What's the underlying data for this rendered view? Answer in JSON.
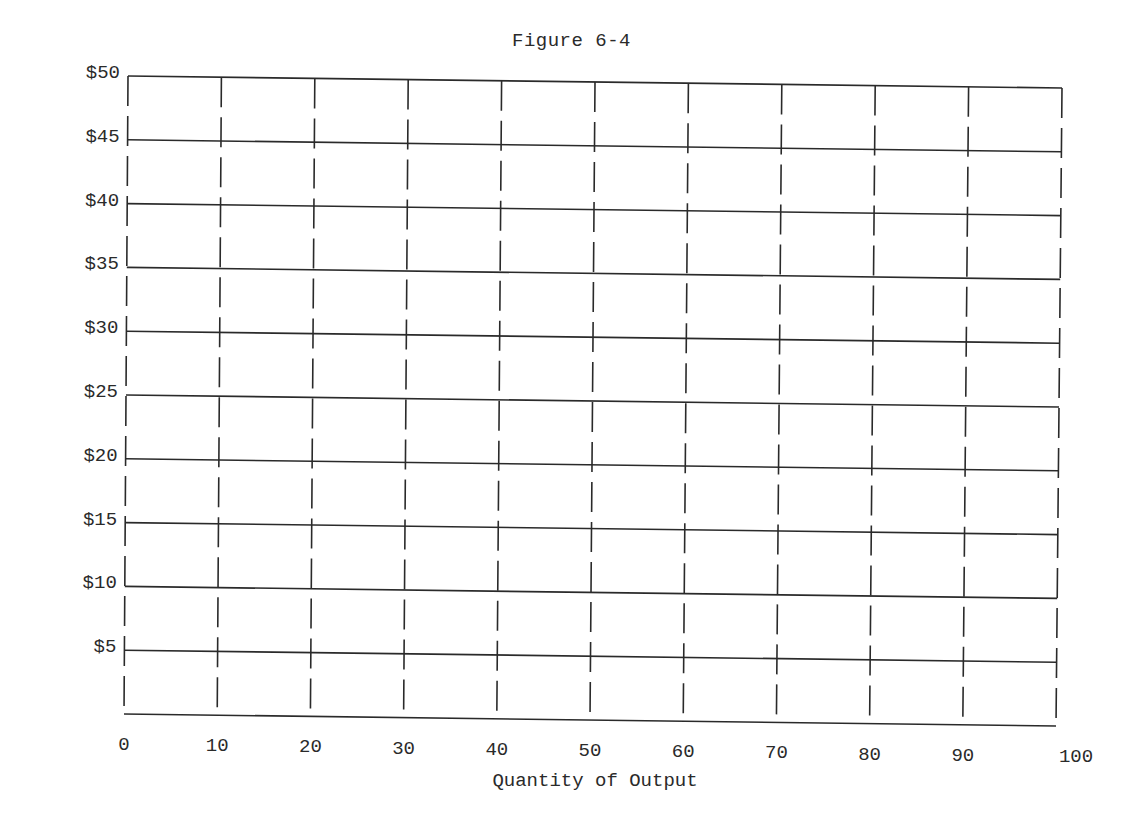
{
  "chart_data": {
    "type": "line",
    "title": "Figure 6-4",
    "xlabel": "Quantity of Output",
    "ylabel": "",
    "x_ticks": [
      0,
      10,
      20,
      30,
      40,
      50,
      60,
      70,
      80,
      90,
      100
    ],
    "x_tick_labels": [
      "0",
      "10",
      "20",
      "30",
      "40",
      "50",
      "60",
      "70",
      "80",
      "90",
      "100"
    ],
    "y_ticks": [
      5,
      10,
      15,
      20,
      25,
      30,
      35,
      40,
      45,
      50
    ],
    "y_tick_labels": [
      "$5",
      "$10",
      "$15",
      "$20",
      "$25",
      "$30",
      "$35",
      "$40",
      "$45",
      "$50"
    ],
    "xlim": [
      0,
      100
    ],
    "ylim": [
      0,
      50
    ],
    "grid": {
      "horizontal": "solid",
      "vertical": "dashed"
    },
    "series": [],
    "legend": null
  },
  "colors": {
    "line": "#2a2a2a",
    "background": "#ffffff"
  }
}
